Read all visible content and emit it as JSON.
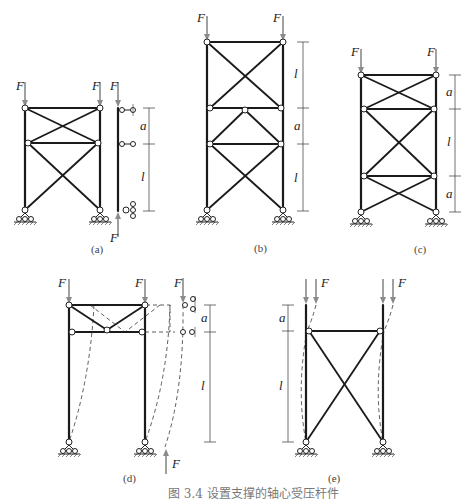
{
  "figure": {
    "caption": "图 3.4   设置支撑的轴心受压杆件",
    "force_label": "F",
    "length_label": "l",
    "spacing_label": "a",
    "subfigures": [
      {
        "id": "a",
        "label": "(a)"
      },
      {
        "id": "b",
        "label": "(b)"
      },
      {
        "id": "c",
        "label": "(c)"
      },
      {
        "id": "d",
        "label": "(d)"
      },
      {
        "id": "e",
        "label": "(e)"
      }
    ]
  }
}
